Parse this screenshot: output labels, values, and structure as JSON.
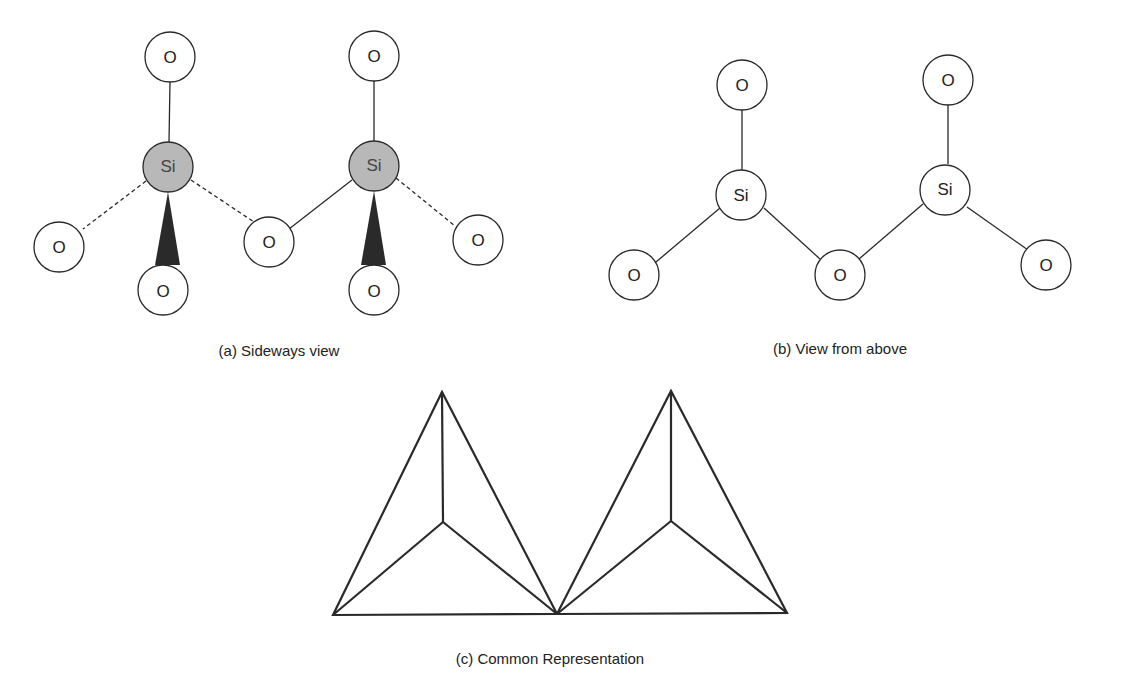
{
  "figure": {
    "panels": [
      {
        "id": "a",
        "caption": "(a) Sideways view",
        "atoms": {
          "si1": "Si",
          "si2": "Si",
          "o_top1": "O",
          "o_left": "O",
          "o_bottom1": "O",
          "o_middle": "O",
          "o_top2": "O",
          "o_bottom2": "O",
          "o_right": "O"
        }
      },
      {
        "id": "b",
        "caption": "(b) View from above",
        "atoms": {
          "si1": "Si",
          "si2": "Si",
          "o_top1": "O",
          "o_left": "O",
          "o_middle": "O",
          "o_top2": "O",
          "o_right": "O"
        }
      },
      {
        "id": "c",
        "caption": "(c) Common Representation"
      }
    ],
    "colors": {
      "line": "#2a2a2a",
      "si_fill_sideways": "#b8b8b8",
      "atom_fill": "#ffffff",
      "wedge": "#2a2a2a"
    }
  }
}
